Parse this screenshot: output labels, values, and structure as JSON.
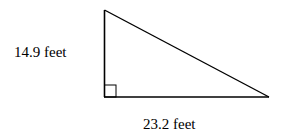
{
  "diagram": {
    "type": "right-triangle",
    "right_angle_marker": true,
    "labels": {
      "vertical_leg": "14.9 feet",
      "horizontal_leg": "23.2 feet"
    },
    "stroke_color": "#000000",
    "background": "#ffffff"
  }
}
